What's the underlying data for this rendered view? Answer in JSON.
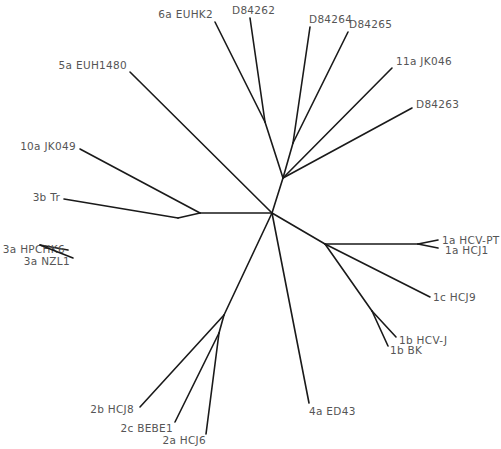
{
  "diagram": {
    "type": "unrooted phylogenetic tree",
    "line_color": "#1a1a1a",
    "label_color": "#555555",
    "nodes": {
      "root": [
        272,
        213
      ],
      "n_upper": [
        283,
        178
      ],
      "n_6a": [
        265,
        122
      ],
      "n_d8426x": [
        293,
        143
      ],
      "n_left": [
        200,
        213
      ],
      "n_3": [
        178,
        218
      ],
      "n_3a": [
        40,
        245
      ],
      "n_right": [
        325,
        244
      ],
      "n_1a": [
        418,
        244
      ],
      "n_1b": [
        372,
        311
      ],
      "n_2": [
        224,
        315
      ],
      "n_2ac": [
        219,
        333
      ]
    },
    "branches": [
      {
        "from": "root",
        "to": "n_upper"
      },
      {
        "from": "n_upper",
        "to": "n_6a"
      },
      {
        "from": "n_upper",
        "to": "n_d8426x"
      },
      {
        "from": "root",
        "to": "n_left"
      },
      {
        "from": "n_left",
        "to": "n_3"
      },
      {
        "from": "root",
        "to": "n_right"
      },
      {
        "from": "n_right",
        "to": "n_1a"
      },
      {
        "from": "n_right",
        "to": "n_1b"
      },
      {
        "from": "root",
        "to": "n_2"
      },
      {
        "from": "n_2",
        "to": "n_2ac"
      }
    ],
    "leaves": [
      {
        "id": "6a-euhk2",
        "label": "6a EUHK2",
        "from": "n_6a",
        "end": [
          215,
          22
        ],
        "text_x": 213,
        "text_y": 18,
        "anchor": "end"
      },
      {
        "id": "d84262",
        "label": "D84262",
        "from": "n_6a",
        "end": [
          250,
          18
        ],
        "text_x": 232,
        "text_y": 14,
        "anchor": "start"
      },
      {
        "id": "d84264",
        "label": "D84264",
        "from": "n_d8426x",
        "end": [
          310,
          27
        ],
        "text_x": 309,
        "text_y": 23,
        "anchor": "start"
      },
      {
        "id": "d84265",
        "label": "D84265",
        "from": "n_d8426x",
        "end": [
          348,
          32
        ],
        "text_x": 349,
        "text_y": 28,
        "anchor": "start"
      },
      {
        "id": "11a-jk046",
        "label": "11a JK046",
        "from": "n_upper",
        "end": [
          392,
          68
        ],
        "text_x": 396,
        "text_y": 65,
        "anchor": "start"
      },
      {
        "id": "d84263",
        "label": "D84263",
        "from": "n_upper",
        "end": [
          412,
          108
        ],
        "text_x": 416,
        "text_y": 108,
        "anchor": "start"
      },
      {
        "id": "5a-euh1480",
        "label": "5a EUH1480",
        "from": "root",
        "end": [
          130,
          72
        ],
        "text_x": 127,
        "text_y": 69,
        "anchor": "end"
      },
      {
        "id": "10a-jk049",
        "label": "10a JK049",
        "from": "n_left",
        "end": [
          80,
          149
        ],
        "text_x": 76,
        "text_y": 150,
        "anchor": "end"
      },
      {
        "id": "3b-tr",
        "label": "3b Tr",
        "from": "n_3",
        "end": [
          64,
          199
        ],
        "text_x": 60,
        "text_y": 201,
        "anchor": "end"
      },
      {
        "id": "3a-hpchk6",
        "label": "3a HPCHK6",
        "from": "n_3a",
        "end": [
          68,
          250
        ],
        "text_x": 65,
        "text_y": 253,
        "anchor": "end",
        "color": "#6a6f7a"
      },
      {
        "id": "3a-nzl1",
        "label": "3a NZL1",
        "from": "n_3a",
        "end": [
          73,
          258
        ],
        "text_x": 70,
        "text_y": 265,
        "anchor": "end"
      },
      {
        "id": "1a-hcv-pt",
        "label": "1a HCV-PT",
        "from": "n_1a",
        "end": [
          438,
          240
        ],
        "text_x": 442,
        "text_y": 244,
        "anchor": "start"
      },
      {
        "id": "1a-hcj1",
        "label": "1a HCJ1",
        "from": "n_1a",
        "end": [
          438,
          248
        ],
        "text_x": 445,
        "text_y": 254,
        "anchor": "start"
      },
      {
        "id": "1c-hcj9",
        "label": "1c HCJ9",
        "from": "n_right",
        "end": [
          430,
          297
        ],
        "text_x": 433,
        "text_y": 301,
        "anchor": "start"
      },
      {
        "id": "1b-hcv-j",
        "label": "1b HCV-J",
        "from": "n_1b",
        "end": [
          396,
          337
        ],
        "text_x": 399,
        "text_y": 344,
        "anchor": "start"
      },
      {
        "id": "1b-bk",
        "label": "1b BK",
        "from": "n_1b",
        "end": [
          388,
          346
        ],
        "text_x": 390,
        "text_y": 354,
        "anchor": "start"
      },
      {
        "id": "4a-ed43",
        "label": "4a ED43",
        "from": "root",
        "end": [
          309,
          403
        ],
        "text_x": 309,
        "text_y": 415,
        "anchor": "start"
      },
      {
        "id": "2b-hcj8",
        "label": "2b HCJ8",
        "from": "n_2",
        "end": [
          140,
          407
        ],
        "text_x": 134,
        "text_y": 413,
        "anchor": "end"
      },
      {
        "id": "2c-bebe1",
        "label": "2c BEBE1",
        "from": "n_2ac",
        "end": [
          175,
          422
        ],
        "text_x": 173,
        "text_y": 432,
        "anchor": "end"
      },
      {
        "id": "2a-hcj6",
        "label": "2a HCJ6",
        "from": "n_2ac",
        "end": [
          206,
          434
        ],
        "text_x": 206,
        "text_y": 444,
        "anchor": "end"
      }
    ]
  }
}
